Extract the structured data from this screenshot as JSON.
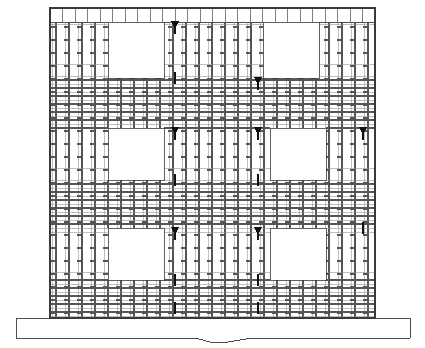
{
  "drawing": {
    "type": "structural-elevation",
    "title": "Reinforced Concrete Shear Wall Elevation",
    "description": "Elevation of a reinforced concrete wall showing two-way reinforcement mesh, six rectangular window openings arranged in three floor levels, floor slab bands, and a foundation footing with a break line.",
    "background_color": "#ffffff",
    "line_color": "#3a3a3a",
    "mesh_color": "#8c8c8c",
    "mesh_dark_color": "#555555",
    "marker_color": "#111111",
    "opening_fill": "#ffffff"
  },
  "wall": {
    "label": "wall-elevation-body",
    "left": 50,
    "right": 375,
    "top": 8,
    "bottom": 318,
    "width": 325,
    "height": 310,
    "outline_width": 1.2
  },
  "parapet": {
    "label": "parapet-band",
    "top": 8,
    "bottom": 22,
    "vertical_bar_count": 26,
    "bar_color": "#4a4a4a"
  },
  "floor_levels": [
    {
      "name": "roof-level",
      "band_top": 8,
      "band_bottom": 22
    },
    {
      "name": "level-3",
      "band_top": 78,
      "band_bottom": 128
    },
    {
      "name": "level-2",
      "band_top": 180,
      "band_bottom": 228
    },
    {
      "name": "level-1",
      "band_top": 280,
      "band_bottom": 318
    }
  ],
  "openings": [
    {
      "name": "opening-r1-c1",
      "x": 108,
      "y": 22,
      "w": 56,
      "h": 56
    },
    {
      "name": "opening-r1-c2",
      "x": 263,
      "y": 22,
      "w": 56,
      "h": 56
    },
    {
      "name": "opening-r2-c1",
      "x": 108,
      "y": 128,
      "w": 56,
      "h": 52
    },
    {
      "name": "opening-r2-c2",
      "x": 270,
      "y": 128,
      "w": 56,
      "h": 52
    },
    {
      "name": "opening-r3-c1",
      "x": 108,
      "y": 228,
      "w": 56,
      "h": 52
    },
    {
      "name": "opening-r3-c2",
      "x": 270,
      "y": 228,
      "w": 56,
      "h": 52
    }
  ],
  "mesh": {
    "label": "reinforcement-mesh",
    "vertical_spacing_px": 13,
    "horizontal_spacing_px": 13,
    "stirrup_spacing_px": 13,
    "bar_thin_width": 0.55,
    "bar_thick_width": 1.3
  },
  "markers": [
    {
      "name": "splice-marker",
      "x": 175,
      "y": 22,
      "type": "triangle-down"
    },
    {
      "name": "splice-marker",
      "x": 175,
      "y": 78,
      "type": "bar-stub"
    },
    {
      "name": "splice-marker",
      "x": 258,
      "y": 78,
      "type": "triangle-down"
    },
    {
      "name": "splice-marker",
      "x": 175,
      "y": 128,
      "type": "triangle-down"
    },
    {
      "name": "splice-marker",
      "x": 258,
      "y": 128,
      "type": "triangle-down"
    },
    {
      "name": "splice-marker",
      "x": 363,
      "y": 128,
      "type": "triangle-down"
    },
    {
      "name": "splice-marker",
      "x": 175,
      "y": 180,
      "type": "bar-stub"
    },
    {
      "name": "splice-marker",
      "x": 258,
      "y": 180,
      "type": "bar-stub"
    },
    {
      "name": "splice-marker",
      "x": 175,
      "y": 228,
      "type": "triangle-down"
    },
    {
      "name": "splice-marker",
      "x": 258,
      "y": 228,
      "type": "triangle-down"
    },
    {
      "name": "splice-marker",
      "x": 363,
      "y": 228,
      "type": "bar-stub"
    },
    {
      "name": "splice-marker",
      "x": 175,
      "y": 280,
      "type": "bar-stub"
    },
    {
      "name": "splice-marker",
      "x": 258,
      "y": 280,
      "type": "bar-stub"
    },
    {
      "name": "splice-marker",
      "x": 175,
      "y": 308,
      "type": "bar-stub"
    },
    {
      "name": "splice-marker",
      "x": 258,
      "y": 308,
      "type": "bar-stub"
    }
  ],
  "foundation": {
    "label": "foundation-footing",
    "left": 16,
    "right": 410,
    "top": 318,
    "bottom": 338,
    "break_symbol": {
      "name": "break-line-zigzag",
      "points": "195,318 195,330 210,330 228,342 252,330 252,318"
    }
  }
}
